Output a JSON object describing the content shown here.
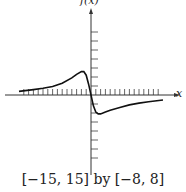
{
  "chart_data": {
    "type": "line",
    "title": "",
    "xlabel": "x",
    "ylabel": "f(x)",
    "window_caption": "[−15, 15] by [−8, 8]",
    "xlim": [
      -15,
      15
    ],
    "ylim": [
      -8,
      8
    ],
    "x_tick_step": 1,
    "y_tick_step": 1,
    "grid": false,
    "series": [
      {
        "name": "f(x)",
        "x": [
          -15,
          -12,
          -10,
          -8,
          -6,
          -4,
          -3,
          -2,
          -1.5,
          -1,
          -0.5,
          0,
          0.5,
          1,
          1.5,
          2,
          3,
          4,
          6,
          8,
          10,
          12,
          15
        ],
        "y": [
          0.4,
          0.6,
          0.75,
          0.95,
          1.3,
          1.9,
          2.3,
          2.6,
          2.6,
          2.2,
          1.2,
          0,
          -1.2,
          -1.9,
          -2.1,
          -2.1,
          -1.9,
          -1.7,
          -1.4,
          -1.1,
          -0.9,
          -0.75,
          -0.55
        ]
      }
    ]
  }
}
